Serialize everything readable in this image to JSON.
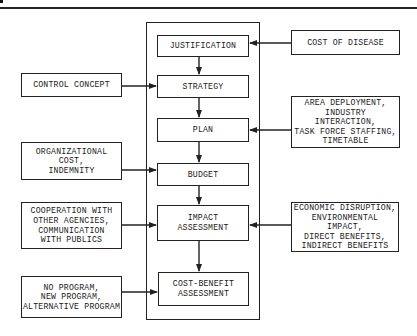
{
  "diagram": {
    "title": "",
    "core_steps": [
      {
        "id": "justification",
        "label": "JUSTIFICATION"
      },
      {
        "id": "strategy",
        "label": "STRATEGY"
      },
      {
        "id": "plan",
        "label": "PLAN"
      },
      {
        "id": "budget",
        "label": "BUDGET"
      },
      {
        "id": "impact",
        "label": "IMPACT\nASSESSMENT"
      },
      {
        "id": "cost_benefit",
        "label": "COST-BENEFIT\nASSESSMENT"
      }
    ],
    "left_inputs": [
      {
        "id": "control_concept",
        "label": "CONTROL CONCEPT",
        "feeds": "strategy"
      },
      {
        "id": "organizational_cost",
        "label": "ORGANIZATIONAL COST,\nINDEMNITY",
        "feeds": "budget"
      },
      {
        "id": "cooperation",
        "label": "COOPERATION WITH\nOTHER AGENCIES,\nCOMMUNICATION\nWITH PUBLICS",
        "feeds": "impact"
      },
      {
        "id": "program_options",
        "label": "NO PROGRAM,\nNEW PROGRAM,\nALTERNATIVE PROGRAM",
        "feeds": "cost_benefit"
      }
    ],
    "right_inputs": [
      {
        "id": "cost_of_disease",
        "label": "COST OF DISEASE",
        "feeds": "justification"
      },
      {
        "id": "area_deployment",
        "label": "AREA DEPLOYMENT,\nINDUSTRY INTERACTION,\nTASK FORCE STAFFING,\nTIMETABLE",
        "feeds": "plan"
      },
      {
        "id": "economic_disruption",
        "label": "ECONOMIC DISRUPTION,\nENVIRONMENTAL IMPACT,\nDIRECT BENEFITS,\nINDIRECT BENEFITS",
        "feeds": "impact"
      }
    ],
    "colors": {
      "line": "#222222",
      "background": "#ffffff",
      "text": "#1a1a1a"
    }
  }
}
